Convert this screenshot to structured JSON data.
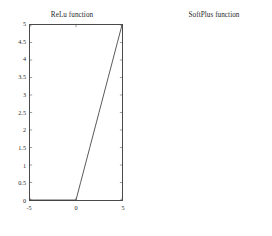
{
  "figure": {
    "background_color": "#ffffff",
    "axis_color": "#4a4a4a",
    "curve_color": "#3a3a3a",
    "panels": [
      {
        "id": "relu",
        "title": "ReLu function"
      },
      {
        "id": "softplus",
        "title": "SoftPlus function"
      }
    ]
  },
  "chart_data": [
    {
      "type": "line",
      "id": "relu",
      "title": "ReLu function",
      "xlabel": "",
      "ylabel": "",
      "xlim": [
        -5,
        5
      ],
      "ylim": [
        0,
        5
      ],
      "grid": false,
      "legend": null,
      "xticks": [
        -5,
        0,
        5
      ],
      "xtick_labels": [
        "-5",
        "0",
        "5"
      ],
      "yticks": [
        0,
        0.5,
        1,
        1.5,
        2,
        2.5,
        3,
        3.5,
        4,
        4.5,
        5
      ],
      "ytick_labels": [
        "0",
        "0.5",
        "1",
        "1.5",
        "2",
        "2.5",
        "3",
        "3.5",
        "4",
        "4.5",
        "5"
      ],
      "series": [
        {
          "name": "relu(x) = max(0, x)",
          "x": [
            -5,
            -4.5,
            -4,
            -3.5,
            -3,
            -2.5,
            -2,
            -1.5,
            -1,
            -0.5,
            0,
            0.5,
            1,
            1.5,
            2,
            2.5,
            3,
            3.5,
            4,
            4.5,
            5
          ],
          "y": [
            0,
            0,
            0,
            0,
            0,
            0,
            0,
            0,
            0,
            0,
            0,
            0.5,
            1,
            1.5,
            2,
            2.5,
            3,
            3.5,
            4,
            4.5,
            5
          ]
        }
      ]
    },
    {
      "type": "line",
      "id": "softplus",
      "title": "SoftPlus function",
      "xlabel": "",
      "ylabel": "",
      "xlim": [
        -5,
        5
      ],
      "ylim": [
        0,
        6
      ],
      "grid": false,
      "legend": null,
      "xticks": [
        -5,
        0,
        5
      ],
      "xtick_labels": [
        "-5",
        "0",
        "5"
      ],
      "yticks": [
        0,
        1,
        2,
        3,
        4,
        5,
        6
      ],
      "ytick_labels": [
        "0",
        "1",
        "2",
        "3",
        "4",
        "5",
        "6"
      ],
      "series": [
        {
          "name": "softplus(x) = ln(1 + e^x)",
          "x": [
            -5,
            -4.5,
            -4,
            -3.5,
            -3,
            -2.5,
            -2,
            -1.5,
            -1,
            -0.5,
            0,
            0.5,
            1,
            1.5,
            2,
            2.5,
            3,
            3.5,
            4,
            4.5,
            5
          ],
          "y": [
            0.0067,
            0.0111,
            0.0181,
            0.0295,
            0.0486,
            0.0789,
            0.1269,
            0.2014,
            0.3133,
            0.4741,
            0.6931,
            0.9741,
            1.3133,
            1.7014,
            2.1269,
            2.5789,
            3.0486,
            3.5295,
            4.0181,
            4.5111,
            5.0067
          ]
        }
      ]
    }
  ]
}
